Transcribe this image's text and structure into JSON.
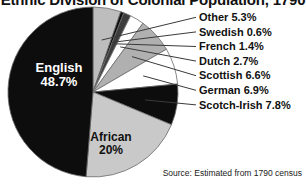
{
  "chart": {
    "title": "Ethnic Division of Colonial Population, 1790",
    "source": "Source: Estimated from 1790 census"
  },
  "labels": {
    "english_name": "English",
    "english_pct": "48.7%",
    "african_name": "African",
    "african_pct": "20%"
  },
  "legend": {
    "items": [
      {
        "label": "Other 5.3%"
      },
      {
        "label": "Swedish 0.6%"
      },
      {
        "label": "French 1.4%"
      },
      {
        "label": "Dutch 2.7%"
      },
      {
        "label": "Scottish 6.6%"
      },
      {
        "label": "German 6.9%"
      },
      {
        "label": "Scotch-Irish 7.8%"
      }
    ]
  },
  "colors": {
    "english": "#0d0d0d",
    "african": "#c9c9c9",
    "scotch_irish": "#0d0d0d",
    "german": "#ffffff",
    "scottish": "#b0b0b0",
    "dutch": "#ffffff",
    "french": "#3d3d3d",
    "swedish": "#0d0d0d",
    "other": "#bdbdbd",
    "outline": "#6b6b6b",
    "leader": "#3a3a3a",
    "text": "#111111"
  },
  "chart_data": {
    "type": "pie",
    "title": "Ethnic Division of Colonial Population, 1790",
    "xlabel": "",
    "ylabel": "",
    "legend_position": "right",
    "grid": false,
    "start_angle_deg": 0,
    "direction": "clockwise",
    "categories": [
      "Other",
      "Swedish",
      "French",
      "Dutch",
      "Scottish",
      "German",
      "Scotch-Irish",
      "African",
      "English"
    ],
    "values": [
      5.3,
      0.6,
      1.4,
      2.7,
      6.6,
      6.9,
      7.8,
      20.0,
      48.7
    ],
    "units": "percent",
    "slice_fills": [
      "#bdbdbd",
      "#0d0d0d",
      "#3d3d3d",
      "#ffffff",
      "#b0b0b0",
      "#ffffff",
      "#0d0d0d",
      "#c9c9c9",
      "#0d0d0d"
    ],
    "inside_labels": [
      {
        "category": "English",
        "text": "English 48.7%"
      },
      {
        "category": "African",
        "text": "African 20%"
      }
    ],
    "callout_labels": [
      "Other 5.3%",
      "Swedish 0.6%",
      "French 1.4%",
      "Dutch 2.7%",
      "Scottish 6.6%",
      "German 6.9%",
      "Scotch-Irish 7.8%"
    ],
    "annotations": [
      "Source: Estimated from 1790 census"
    ]
  }
}
